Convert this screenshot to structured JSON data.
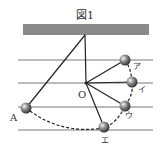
{
  "figure": {
    "title": "図1",
    "pivot_label": "O",
    "start_label": "A",
    "positions": [
      {
        "label": "ア",
        "x": 125,
        "y": 60
      },
      {
        "label": "イ",
        "x": 132,
        "y": 82
      },
      {
        "label": "ウ",
        "x": 125,
        "y": 106
      },
      {
        "label": "エ",
        "x": 104,
        "y": 127
      }
    ],
    "start_ball": {
      "x": 26,
      "y": 108
    },
    "colors": {
      "ceiling": "#8a8a8a",
      "line": "#222222",
      "grid": "#555555"
    }
  }
}
